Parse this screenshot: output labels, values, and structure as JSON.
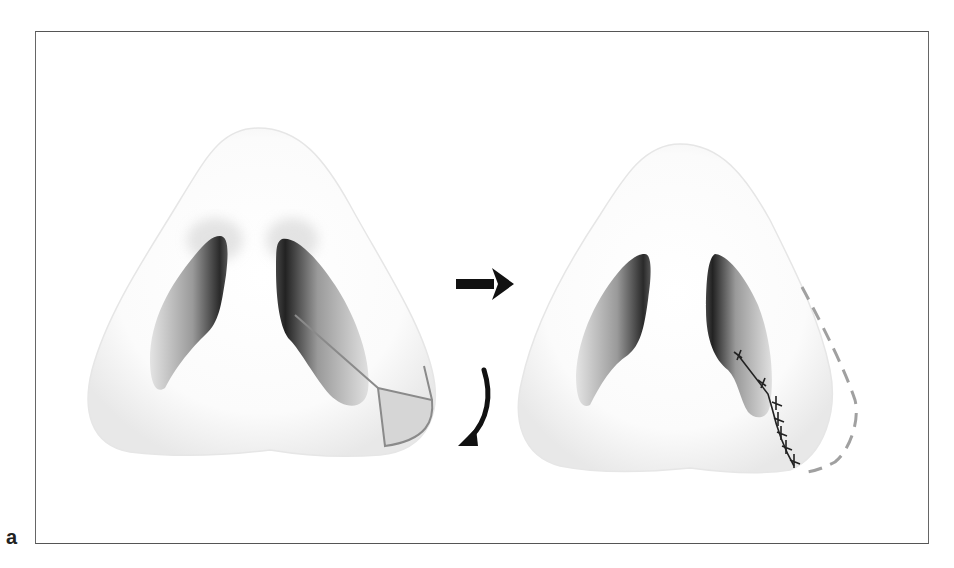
{
  "figure": {
    "panel_label": "a",
    "panels": [
      {
        "name": "before",
        "features": [
          "nasal-base",
          "left-nostril",
          "right-nostril",
          "excision-outline"
        ]
      },
      {
        "name": "after",
        "features": [
          "nasal-base",
          "left-nostril",
          "right-nostril",
          "suture-line",
          "original-contour-dashed"
        ]
      }
    ],
    "arrows": [
      {
        "name": "transition-arrow",
        "direction": "right"
      },
      {
        "name": "rotation-arrow",
        "direction": "down-left-curved"
      }
    ],
    "colors": {
      "frame": "#555555",
      "outline_gray": "#8a8a8a",
      "excision_fill": "#d6d6d6",
      "dashed_contour": "#a0a0a0",
      "arrow": "#111111"
    }
  }
}
